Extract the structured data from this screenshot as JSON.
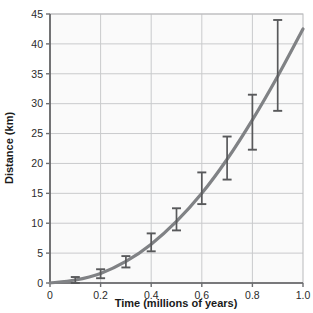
{
  "chart_data": {
    "type": "line",
    "title": "",
    "xlabel": "Time (millions of years)",
    "ylabel": "Distance (km)",
    "xlim": [
      0,
      1.0
    ],
    "ylim": [
      0,
      45
    ],
    "grid": true,
    "legend": "none",
    "xticks": [
      "0",
      "0.2",
      "0.4",
      "0.6",
      "0.8",
      "1.0"
    ],
    "xtick_values": [
      0,
      0.2,
      0.4,
      0.6,
      0.8,
      1.0
    ],
    "yticks": [
      "0",
      "5",
      "10",
      "15",
      "20",
      "25",
      "30",
      "35",
      "40",
      "45"
    ],
    "ytick_values": [
      0,
      5,
      10,
      15,
      20,
      25,
      30,
      35,
      40,
      45
    ],
    "x": [
      0.1,
      0.2,
      0.3,
      0.4,
      0.5,
      0.6,
      0.7,
      0.8,
      0.9
    ],
    "values": [
      0.5,
      1.5,
      3.5,
      6.5,
      10.0,
      15.5,
      20.5,
      26.5,
      35.0
    ],
    "error_low": [
      0.0,
      0.8,
      2.6,
      5.3,
      8.8,
      13.2,
      17.3,
      22.3,
      28.8
    ],
    "error_high": [
      1.0,
      2.3,
      4.5,
      8.3,
      12.5,
      18.5,
      24.5,
      31.5,
      44.0
    ],
    "fit_curve": {
      "x": [
        0,
        0.1,
        0.2,
        0.3,
        0.4,
        0.5,
        0.6,
        0.7,
        0.8,
        0.9,
        1.0
      ],
      "y": [
        0,
        0.5,
        1.6,
        3.6,
        6.5,
        10.3,
        15.0,
        20.7,
        27.3,
        34.6,
        42.5
      ]
    },
    "series_color": "#808285",
    "errorbar_color": "#58595b",
    "grid_color": "#c9cacc",
    "axis_color": "#6d6e71",
    "plot_background": "#fafafa"
  }
}
